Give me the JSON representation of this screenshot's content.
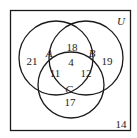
{
  "diagram": {
    "type": "venn-3-set",
    "universe_label": "U",
    "sets": [
      {
        "name": "A",
        "label": "A"
      },
      {
        "name": "B",
        "label": "B"
      },
      {
        "name": "C",
        "label": "C"
      }
    ],
    "regions": {
      "a_only": "21",
      "a_and_b_only": "18",
      "b_only": "19",
      "a_and_b_and_c": "4",
      "a_and_c_only": "11",
      "b_and_c_only": "12",
      "c_only": "17",
      "outside": "14"
    },
    "colors": {
      "stroke": "#1a1a1a",
      "background": "#ffffff"
    }
  }
}
